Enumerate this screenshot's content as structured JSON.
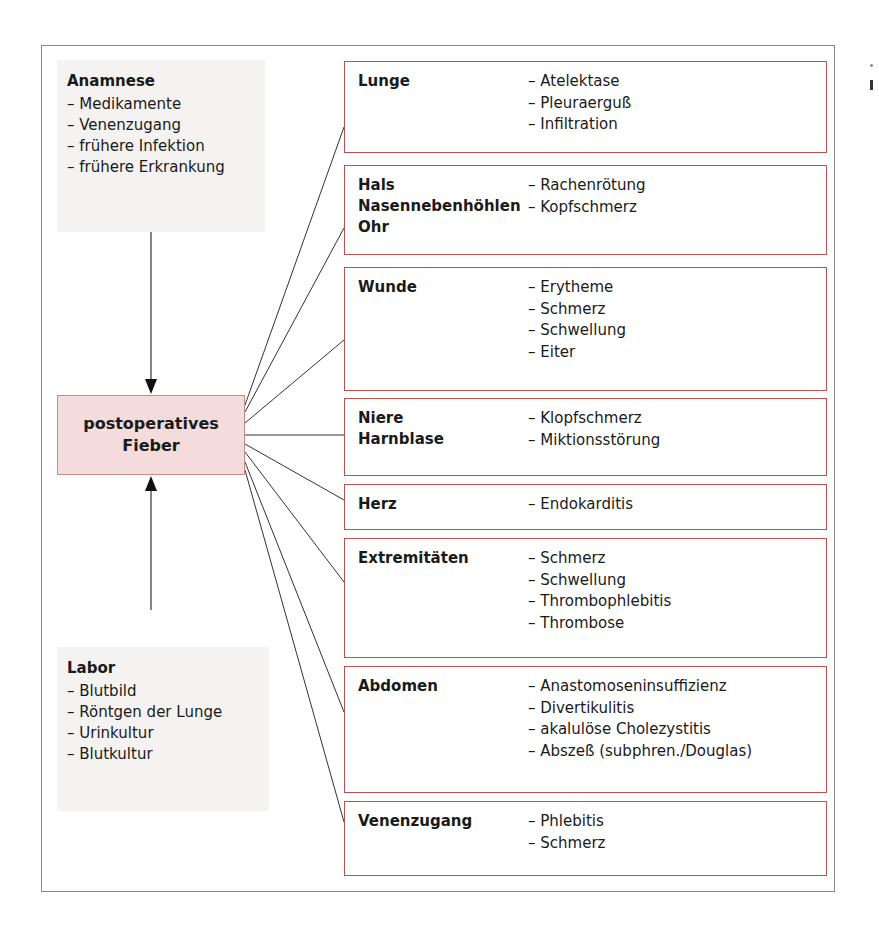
{
  "diagram": {
    "center": {
      "line1": "postoperatives",
      "line2": "Fieber",
      "fill": "#f3dcdb",
      "border": "#c98a88"
    },
    "anamnese": {
      "title": "Anamnese",
      "items": [
        "– Medikamente",
        "– Venenzugang",
        "– frühere Infektion",
        "– frühere Erkrankung"
      ]
    },
    "labor": {
      "title": "Labor",
      "items": [
        "– Blutbild",
        "– Röntgen der Lunge",
        "– Urinkultur",
        "– Blutkultur"
      ]
    },
    "categories": [
      {
        "names": [
          "Lunge"
        ],
        "symptoms": [
          "– Atelektase",
          "– Pleuraerguß",
          "– Infiltration"
        ]
      },
      {
        "names": [
          "Hals",
          "Nasennebenhöhlen",
          "Ohr"
        ],
        "symptoms": [
          "– Rachenrötung",
          "– Kopfschmerz"
        ]
      },
      {
        "names": [
          "Wunde"
        ],
        "symptoms": [
          "– Erytheme",
          "– Schmerz",
          "– Schwellung",
          "– Eiter"
        ]
      },
      {
        "names": [
          "Niere",
          "Harnblase"
        ],
        "symptoms": [
          "– Klopfschmerz",
          "– Miktionsstörung"
        ]
      },
      {
        "names": [
          "Herz"
        ],
        "symptoms": [
          "– Endokarditis"
        ]
      },
      {
        "names": [
          "Extremitäten"
        ],
        "symptoms": [
          "– Schmerz",
          "– Schwellung",
          "– Thrombophlebitis",
          "– Thrombose"
        ]
      },
      {
        "names": [
          "Abdomen"
        ],
        "symptoms": [
          "– Anastomoseninsuffizienz",
          "– Divertikulitis",
          "– akalulöse Cholezystitis",
          "– Abszeß (subphren./Douglas)"
        ]
      },
      {
        "names": [
          "Venenzugang"
        ],
        "symptoms": [
          "– Phlebitis",
          "– Schmerz"
        ]
      }
    ],
    "colors": {
      "category_border": "#c0504d",
      "info_fill": "#f4f3f1",
      "frame_border": "#8a8a8a",
      "connector": "#333333"
    }
  }
}
